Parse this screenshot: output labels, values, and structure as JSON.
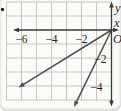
{
  "colors": {
    "background": "#fbfbf8",
    "grid": "#c6c6c1",
    "axis": "#383838",
    "ray": "#4e4e4e",
    "text": "#1c1c1c"
  },
  "bullet_icon": "square-bullet",
  "chart_data": {
    "type": "line",
    "title": "",
    "x_label": "x",
    "y_label": "y",
    "origin_label": "O",
    "x_ticks": [
      -6,
      -4,
      -2
    ],
    "y_ticks": [
      -2,
      -4
    ],
    "xlim": [
      -7,
      0.6
    ],
    "ylim": [
      -5.8,
      2
    ],
    "grid": true,
    "legend": false,
    "series": [
      {
        "name": "ray-slope-two-thirds",
        "slope": 0.66,
        "points": [
          [
            0,
            0
          ],
          [
            -6.2,
            -4.1
          ]
        ],
        "arrow_end": true
      },
      {
        "name": "ray-slope-two",
        "slope": 2.1,
        "points": [
          [
            0,
            0
          ],
          [
            -2.5,
            -5.5
          ]
        ],
        "arrow_end": true
      }
    ]
  }
}
